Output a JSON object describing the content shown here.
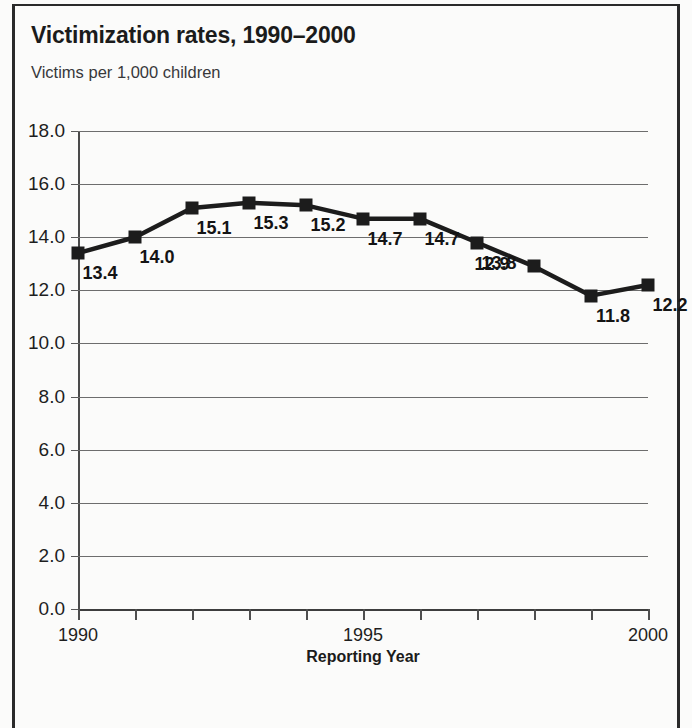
{
  "chart_data": {
    "type": "line",
    "title": "Victimization rates, 1990–2000",
    "subtitle": "Victims per 1,000 children",
    "xlabel": "Reporting Year",
    "ylabel": "",
    "x": [
      1990,
      1991,
      1992,
      1993,
      1994,
      1995,
      1996,
      1997,
      1998,
      1999,
      2000
    ],
    "values": [
      13.4,
      14.0,
      15.1,
      15.3,
      15.2,
      14.7,
      14.7,
      13.8,
      12.9,
      11.8,
      12.2
    ],
    "point_labels": [
      "13.4",
      "14.0",
      "15.1",
      "15.3",
      "15.2",
      "14.7",
      "14.7",
      "13.8",
      "12.9",
      "11.8",
      "12.2"
    ],
    "label_side": [
      "right",
      "right",
      "right",
      "right",
      "right",
      "right",
      "right",
      "right",
      "left",
      "right",
      "right"
    ],
    "xlim": [
      1990,
      2000
    ],
    "ylim": [
      0.0,
      18.0
    ],
    "ytick_values": [
      18.0,
      16.0,
      14.0,
      12.0,
      10.0,
      8.0,
      6.0,
      4.0,
      2.0,
      0.0
    ],
    "ytick_labels": [
      "18.0",
      "16.0",
      "14.0",
      "12.0",
      "10.0",
      "8.0",
      "6.0",
      "4.0",
      "2.0",
      "0.0"
    ],
    "xtick_values": [
      1990,
      1991,
      1992,
      1993,
      1994,
      1995,
      1996,
      1997,
      1998,
      1999,
      2000
    ],
    "xtick_labels": [
      "1990",
      "",
      "",
      "",
      "",
      "1995",
      "",
      "",
      "",
      "",
      "2000"
    ],
    "grid": "horizontal",
    "legend": "none",
    "marker": "square",
    "series_color": "#1c1c1c",
    "grid_color": "#6d6d6d",
    "background_color": "#fbfbfa"
  }
}
